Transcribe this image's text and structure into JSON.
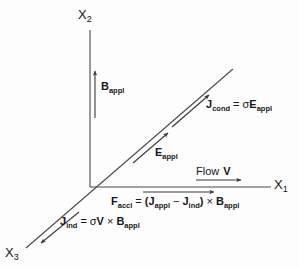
{
  "figure": {
    "type": "vector-diagram",
    "stroke_color": "#3a3a3a",
    "text_color": "#171717",
    "background": "#fdfdfd"
  },
  "axes": [
    {
      "id": "x1",
      "label": "X",
      "subscript": "1",
      "direction": "right"
    },
    {
      "id": "x2",
      "label": "X",
      "subscript": "2",
      "direction": "up"
    },
    {
      "id": "x3",
      "label": "X",
      "subscript": "3",
      "direction": "down-left"
    }
  ],
  "vectors": {
    "b_appl": {
      "symbol": "B",
      "subscript": "appl",
      "direction": "up"
    },
    "e_appl": {
      "symbol": "E",
      "subscript": "appl",
      "direction": "up-right"
    },
    "j_cond": {
      "symbol": "J",
      "subscript": "cond",
      "equals": "=",
      "sigma": "σ",
      "rhs_symbol": "E",
      "rhs_subscript": "appl",
      "direction": "up-right"
    },
    "j_ind": {
      "symbol": "J",
      "subscript": "ind",
      "equals": "=",
      "sigma": "σ",
      "rhs_symbol": "V",
      "cross": "×",
      "rhs_symbol2": "B",
      "rhs_subscript2": "appl",
      "direction": "down-left"
    },
    "flow_v": {
      "text": "Flow",
      "symbol": "V",
      "direction": "right"
    },
    "f_accl": {
      "symbol": "F",
      "subscript": "accl",
      "equals": "=",
      "open_paren": "(",
      "term1_symbol": "J",
      "term1_subscript": "appl",
      "minus": "−",
      "term2_symbol": "J",
      "term2_subscript": "ind",
      "close_paren": ")",
      "cross": "×",
      "rhs_symbol": "B",
      "rhs_subscript": "appl",
      "direction": "right"
    }
  }
}
